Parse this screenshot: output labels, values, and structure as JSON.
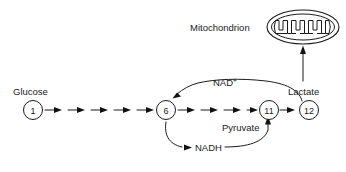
{
  "diagram": {
    "type": "pathway-diagram",
    "background_color": "#ffffff",
    "line_color": "#1a1a1a"
  },
  "labels": {
    "glucose": "Glucose",
    "nad_plus": "NAD",
    "nad_plus_sup": "+",
    "nadh": "NADH",
    "pyruvate": "Pyruvate",
    "lactate": "Lactate",
    "mitochondrion": "Mitochondrion"
  },
  "nodes": [
    {
      "id": "n1",
      "number": "1",
      "label": "Glucose",
      "cx": 33,
      "cy": 110
    },
    {
      "id": "n6",
      "number": "6",
      "label": "",
      "cx": 166,
      "cy": 110
    },
    {
      "id": "n11",
      "number": "11",
      "label": "Pyruvate",
      "cx": 269,
      "cy": 110
    },
    {
      "id": "n12",
      "number": "12",
      "label": "Lactate",
      "cx": 309,
      "cy": 110
    }
  ],
  "arrow_chains": [
    {
      "from": "n1",
      "to": "n6",
      "count": 5
    },
    {
      "from": "n6",
      "to": "n11",
      "count": 4
    },
    {
      "from": "n11",
      "to": "n12",
      "count": 1
    }
  ],
  "curves": [
    {
      "id": "nad-plus-curve",
      "label": "NAD+",
      "from": "n12-region",
      "to": "n6",
      "direction": "right-to-left-arc-above"
    },
    {
      "id": "nadh-curve",
      "label": "NADH",
      "from": "n6",
      "to": "n11-n12-link",
      "direction": "left-to-right-arc-below"
    },
    {
      "id": "lactate-to-mitochondrion",
      "label": "",
      "from": "n12",
      "to": "mitochondrion",
      "direction": "upward"
    }
  ],
  "organelle": {
    "name": "mitochondrion",
    "cx": 303,
    "cy": 27,
    "rx": 36,
    "ry": 17,
    "cristae_count": 5
  }
}
